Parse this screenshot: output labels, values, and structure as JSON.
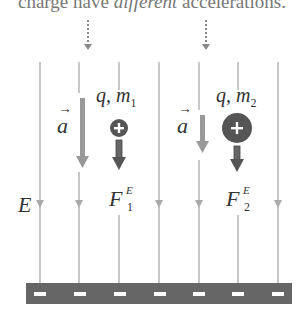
{
  "caption": {
    "prefix": "charge have ",
    "emphasis": "different",
    "suffix": " accelerations."
  },
  "labels": {
    "accel1": "a",
    "accel2": "a",
    "particle1": "q, m",
    "particle1_sub": "1",
    "particle2": "q, m",
    "particle2_sub": "2",
    "field": "E",
    "force1": "F",
    "force1_sub": "1",
    "force1_sup": "E",
    "force2": "F",
    "force2_sub": "2",
    "force2_sup": "E"
  },
  "plate": {
    "charge_symbol": "−",
    "count": 7
  },
  "colors": {
    "field_line": "#aaaaaa",
    "accel_arrow": "#999999",
    "force_arrow": "#555555",
    "particle": "#555555",
    "plate": "#666666"
  }
}
